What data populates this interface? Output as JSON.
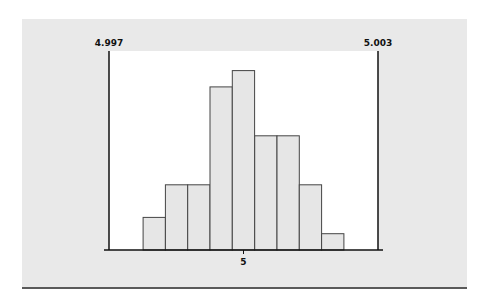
{
  "chart_data": {
    "type": "bar",
    "subtype": "histogram",
    "title": "",
    "xlabel": "",
    "ylabel": "",
    "bin_width": 0.0005,
    "bin_centers": [
      4.998,
      4.9985,
      4.999,
      4.9995,
      5.0,
      5.0005,
      5.001,
      5.0015,
      5.002
    ],
    "values": [
      2,
      4,
      4,
      10,
      11,
      7,
      7,
      4,
      1
    ],
    "xlim": [
      4.997,
      5.003
    ],
    "ylim": [
      0,
      12.2
    ],
    "x_ticks": [
      {
        "value": 4.997,
        "label": "4.997",
        "position": "top"
      },
      {
        "value": 5.0,
        "label": "5",
        "position": "bottom"
      },
      {
        "value": 5.003,
        "label": "5.003",
        "position": "top"
      }
    ],
    "grid": false,
    "legend": "none",
    "colors": {
      "bar_fill": "#e6e6e6",
      "bar_stroke": "#444444",
      "plot_bg": "#ffffff",
      "panel_bg": "#e9e9e9",
      "axis": "#111111"
    }
  }
}
